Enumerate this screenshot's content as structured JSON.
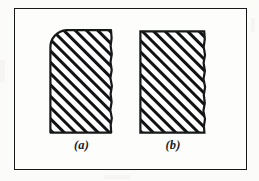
{
  "figure": {
    "background_color": "#fbfbfa",
    "ink_color": "#17181a",
    "frame": {
      "name": "figure-border",
      "x": 14,
      "y": 8,
      "width": 233,
      "height": 162,
      "stroke_color": "#17181a",
      "stroke_width": 1.6,
      "fill_color": "#fdfdfc"
    },
    "hatching": {
      "angle_degrees": 45,
      "direction": "lower-left to upper-right",
      "line_color": "#111214",
      "line_thickness": 3,
      "pitch": 8
    },
    "shapes": [
      {
        "id": "a",
        "name": "hatched-block-rounded-corner",
        "corner_style": "rounded top-left",
        "corner_radius": 17,
        "x": 49,
        "y": 29,
        "width": 65,
        "height": 105,
        "left_edge": "straight",
        "bottom_edge": "straight",
        "right_edge": "irregular break line",
        "top_edge": "straight"
      },
      {
        "id": "b",
        "name": "hatched-block-square-corner",
        "corner_style": "square",
        "corner_radius": 0,
        "x": 139,
        "y": 30,
        "width": 68,
        "height": 104,
        "left_edge": "straight",
        "bottom_edge": "straight",
        "right_edge": "irregular break line",
        "top_edge": "straight"
      }
    ],
    "captions": [
      {
        "id": "a",
        "label": "(a)"
      },
      {
        "id": "b",
        "label": "(b)"
      }
    ]
  }
}
